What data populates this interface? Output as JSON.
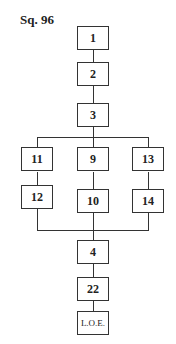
{
  "title": "Sq. 96",
  "nodes": {
    "n1": "1",
    "n2": "2",
    "n3": "3",
    "n11": "11",
    "n9": "9",
    "n13": "13",
    "n12": "12",
    "n10": "10",
    "n14": "14",
    "n4": "4",
    "n22": "22",
    "loe": "L.O.E."
  },
  "edges": [
    [
      "1",
      "2"
    ],
    [
      "2",
      "3"
    ],
    [
      "3",
      "11"
    ],
    [
      "3",
      "9"
    ],
    [
      "3",
      "13"
    ],
    [
      "11",
      "12"
    ],
    [
      "9",
      "10"
    ],
    [
      "13",
      "14"
    ],
    [
      "12",
      "4"
    ],
    [
      "10",
      "4"
    ],
    [
      "14",
      "4"
    ],
    [
      "4",
      "22"
    ],
    [
      "22",
      "L.O.E."
    ]
  ]
}
